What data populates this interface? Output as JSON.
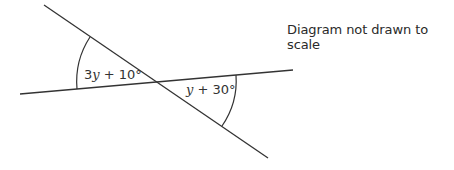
{
  "diagram": {
    "note": "Diagram not drawn to scale",
    "angles": [
      {
        "coef": "3",
        "variable": "y",
        "rest": " + 10°"
      },
      {
        "coef": "",
        "variable": "y",
        "rest": " + 30°"
      }
    ],
    "line_color": "#333333"
  }
}
